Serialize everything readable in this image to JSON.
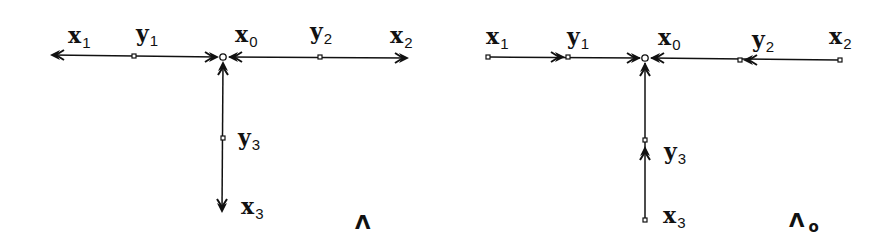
{
  "diagrams": [
    {
      "id": "left",
      "caption": {
        "main": "Λ",
        "sub": ""
      },
      "labels": {
        "x1": {
          "base": "x",
          "sub": "1"
        },
        "y1": {
          "base": "y",
          "sub": "1"
        },
        "x0": {
          "base": "x",
          "sub": "0"
        },
        "y2": {
          "base": "y",
          "sub": "2"
        },
        "x2": {
          "base": "x",
          "sub": "2"
        },
        "y3": {
          "base": "y",
          "sub": "3"
        },
        "x3": {
          "base": "x",
          "sub": "3"
        }
      },
      "edges_description": "arrows point from center x0 outward toward x1, x2, x3; arrowheads also converge at x0"
    },
    {
      "id": "right",
      "caption": {
        "main": "Λ",
        "sub": "o"
      },
      "labels": {
        "x1": {
          "base": "x",
          "sub": "1"
        },
        "y1": {
          "base": "y",
          "sub": "1"
        },
        "x0": {
          "base": "x",
          "sub": "0"
        },
        "y2": {
          "base": "y",
          "sub": "2"
        },
        "x2": {
          "base": "x",
          "sub": "2"
        },
        "y3": {
          "base": "y",
          "sub": "3"
        },
        "x3": {
          "base": "x",
          "sub": "3"
        }
      },
      "edges_description": "arrows point inward from outer nodes x1, x2, x3 through y1, y2, y3 toward center x0"
    }
  ],
  "colors": {
    "ink": "#111111",
    "background": "#ffffff"
  }
}
